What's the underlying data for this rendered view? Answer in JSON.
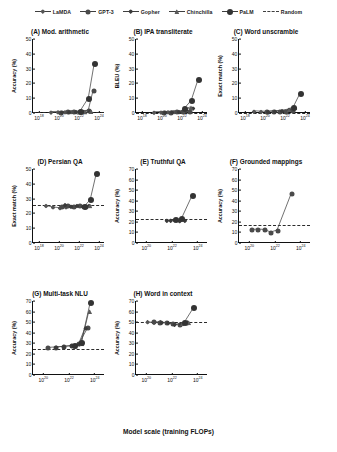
{
  "figure": {
    "xaxis_caption": "Model scale (training FLOPs)",
    "legend": [
      {
        "label": "LaMDA",
        "marker": "diamond",
        "style": "solid",
        "color": "#555555"
      },
      {
        "label": "GPT-3",
        "marker": "circle",
        "style": "solid",
        "color": "#4a4a4a"
      },
      {
        "label": "Gopher",
        "marker": "diamond",
        "style": "solid",
        "color": "#3a3a3a"
      },
      {
        "label": "Chinchilla",
        "marker": "triangle",
        "style": "solid",
        "color": "#5a5a5a"
      },
      {
        "label": "PaLM",
        "marker": "circle",
        "style": "solid",
        "color": "#333333"
      },
      {
        "label": "Random",
        "marker": "none",
        "style": "dashed",
        "color": "#3f3f3f"
      }
    ]
  },
  "chart_data": [
    {
      "type": "line",
      "panel": "A",
      "title": "(A) Mod. arithmetic",
      "xlabel": "",
      "ylabel": "Accuracy (%)",
      "ylim": [
        0,
        50
      ],
      "yticks": [
        0,
        10,
        20,
        30,
        40,
        50
      ],
      "xlim_log10": [
        17.4,
        24.6
      ],
      "xticks_log10": [
        18,
        20,
        22,
        24
      ],
      "xtick_labels": [
        "10^18",
        "10^20",
        "10^22",
        "10^24"
      ],
      "grid": false,
      "random_baseline": 0.4,
      "series": [
        {
          "name": "LaMDA",
          "x_log10": [
            19.2,
            19.9,
            20.6,
            21.2,
            21.5
          ],
          "values": [
            0.3,
            0.4,
            0.4,
            0.5,
            0.5
          ]
        },
        {
          "name": "GPT-3",
          "x_log10": [
            20.2,
            20.9,
            21.5,
            22.1,
            23.0,
            23.5
          ],
          "values": [
            0.3,
            0.4,
            0.5,
            0.6,
            1.2,
            15.0
          ]
        },
        {
          "name": "Gopher",
          "x_log10": [
            20.3,
            21.0,
            21.7,
            22.4,
            23.1
          ],
          "values": [
            0.3,
            0.4,
            0.5,
            0.6,
            1.0
          ]
        },
        {
          "name": "Chinchilla",
          "x_log10": [
            22.0,
            22.6,
            23.2
          ],
          "values": [
            0.4,
            0.6,
            1.0
          ]
        },
        {
          "name": "PaLM",
          "x_log10": [
            22.2,
            23.0,
            23.6
          ],
          "values": [
            1.0,
            9.5,
            33.0
          ]
        }
      ]
    },
    {
      "type": "line",
      "panel": "B",
      "title": "(B) IPA transliterate",
      "xlabel": "",
      "ylabel": "BLEU (%)",
      "ylim": [
        0,
        50
      ],
      "yticks": [
        0,
        10,
        20,
        30,
        40,
        50
      ],
      "xlim_log10": [
        17.4,
        24.6
      ],
      "xticks_log10": [
        18,
        20,
        22,
        24
      ],
      "xtick_labels": [
        "10^18",
        "10^20",
        "10^22",
        "10^24"
      ],
      "grid": false,
      "random_baseline": 0.3,
      "series": [
        {
          "name": "LaMDA",
          "x_log10": [
            19.2,
            19.9,
            20.6,
            21.2
          ],
          "values": [
            0.2,
            0.3,
            0.4,
            0.5
          ]
        },
        {
          "name": "GPT-3",
          "x_log10": [
            20.2,
            20.9,
            21.5,
            22.1,
            22.8
          ],
          "values": [
            0.2,
            0.3,
            0.4,
            0.6,
            1.0
          ]
        },
        {
          "name": "Gopher",
          "x_log10": [
            20.3,
            21.0,
            21.7,
            22.4,
            23.1
          ],
          "values": [
            0.3,
            0.4,
            0.5,
            1.5,
            3.0
          ]
        },
        {
          "name": "Chinchilla",
          "x_log10": [
            22.3,
            22.9
          ],
          "values": [
            1.8,
            3.5
          ]
        },
        {
          "name": "PaLM",
          "x_log10": [
            22.3,
            23.0,
            23.7
          ],
          "values": [
            2.5,
            8.0,
            22.5
          ]
        }
      ]
    },
    {
      "type": "line",
      "panel": "C",
      "title": "(C) Word unscramble",
      "xlabel": "",
      "ylabel": "Exact match (%)",
      "ylim": [
        0,
        50
      ],
      "yticks": [
        0,
        10,
        20,
        30,
        40,
        50
      ],
      "xlim_log10": [
        17.4,
        24.6
      ],
      "xticks_log10": [
        18,
        20,
        22,
        24
      ],
      "xtick_labels": [
        "10^18",
        "10^20",
        "10^22",
        "10^24"
      ],
      "grid": false,
      "random_baseline": 0.3,
      "series": [
        {
          "name": "LaMDA",
          "x_log10": [
            18.9,
            19.6,
            20.3
          ],
          "values": [
            0.8,
            0.6,
            0.5
          ]
        },
        {
          "name": "GPT-3",
          "x_log10": [
            20.2,
            20.9,
            21.5,
            22.1,
            22.8
          ],
          "values": [
            0.6,
            0.7,
            0.8,
            1.0,
            1.6
          ]
        },
        {
          "name": "Gopher",
          "x_log10": [
            20.3,
            21.0,
            21.7,
            22.4,
            23.0
          ],
          "values": [
            0.5,
            0.8,
            1.2,
            2.0,
            3.2
          ]
        },
        {
          "name": "Chinchilla",
          "x_log10": [
            22.4,
            23.0
          ],
          "values": [
            2.2,
            3.5
          ]
        },
        {
          "name": "PaLM",
          "x_log10": [
            22.9,
            23.6
          ],
          "values": [
            3.5,
            13.0
          ]
        }
      ]
    },
    {
      "type": "line",
      "panel": "D",
      "title": "(D) Persian QA",
      "xlabel": "",
      "ylabel": "Exact match (%)",
      "ylim": [
        0,
        50
      ],
      "yticks": [
        0,
        10,
        20,
        30,
        40,
        50
      ],
      "xlim_log10": [
        17.4,
        24.6
      ],
      "xticks_log10": [
        18,
        20,
        22,
        24
      ],
      "xtick_labels": [
        "10^18",
        "10^20",
        "10^22",
        "10^24"
      ],
      "grid": false,
      "random_baseline": 25.5,
      "series": [
        {
          "name": "LaMDA",
          "x_log10": [
            18.7,
            19.4,
            20.1,
            20.7
          ],
          "values": [
            25.0,
            24.0,
            23.5,
            24.0
          ]
        },
        {
          "name": "GPT-3",
          "x_log10": [
            20.3,
            20.9,
            21.5,
            22.1,
            22.7
          ],
          "values": [
            24.5,
            25.0,
            24.5,
            25.0,
            24.0
          ]
        },
        {
          "name": "Gopher",
          "x_log10": [
            20.6,
            21.2,
            21.8,
            22.4,
            23.0
          ],
          "values": [
            25.5,
            24.5,
            25.0,
            24.5,
            25.0
          ]
        },
        {
          "name": "Chinchilla",
          "x_log10": [
            22.5,
            23.1
          ],
          "values": [
            24.5,
            25.0
          ]
        },
        {
          "name": "PaLM",
          "x_log10": [
            22.6,
            23.2,
            23.8
          ],
          "values": [
            24.5,
            29.0,
            46.5
          ]
        }
      ]
    },
    {
      "type": "line",
      "panel": "E",
      "title": "(E) Truthful QA",
      "xlabel": "",
      "ylabel": "Accuracy (%)",
      "ylim": [
        0,
        70
      ],
      "yticks": [
        0,
        10,
        20,
        30,
        40,
        50,
        60,
        70
      ],
      "xlim_log10": [
        19.2,
        24.8
      ],
      "xticks_log10": [
        20,
        22,
        24
      ],
      "xtick_labels": [
        "10^20",
        "10^22",
        "10^24"
      ],
      "grid": false,
      "random_baseline": 23.0,
      "series": [
        {
          "name": "Gopher",
          "x_log10": [
            21.6,
            21.9,
            22.2,
            22.6,
            23.0
          ],
          "values": [
            21.0,
            21.0,
            21.5,
            20.5,
            21.0
          ]
        },
        {
          "name": "PaLM",
          "x_log10": [
            22.3,
            22.8,
            23.6
          ],
          "values": [
            21.5,
            23.0,
            44.0
          ]
        }
      ]
    },
    {
      "type": "line",
      "panel": "F",
      "title": "(F) Grounded mappings",
      "xlabel": "",
      "ylabel": "Accuracy (%)",
      "ylim": [
        0,
        70
      ],
      "yticks": [
        0,
        10,
        20,
        30,
        40,
        50,
        60,
        70
      ],
      "xlim_log10": [
        19.2,
        24.8
      ],
      "xticks_log10": [
        20,
        22,
        24
      ],
      "xtick_labels": [
        "10^20",
        "10^22",
        "10^24"
      ],
      "grid": false,
      "random_baseline": 17.0,
      "series": [
        {
          "name": "GPT-3",
          "x_log10": [
            20.2,
            20.7,
            21.2,
            21.7,
            22.2,
            23.3
          ],
          "values": [
            12.0,
            12.5,
            12.0,
            9.5,
            11.5,
            46.0
          ]
        }
      ]
    },
    {
      "type": "line",
      "panel": "G",
      "title": "(G) Multi-task NLU",
      "xlabel": "",
      "ylabel": "Accuracy (%)",
      "ylim": [
        0,
        70
      ],
      "yticks": [
        0,
        10,
        20,
        30,
        40,
        50,
        60,
        70
      ],
      "xlim_log10": [
        19.2,
        24.8
      ],
      "xticks_log10": [
        20,
        22,
        24
      ],
      "xtick_labels": [
        "10^20",
        "10^22",
        "10^24"
      ],
      "grid": false,
      "random_baseline": 25.0,
      "series": [
        {
          "name": "GPT-3",
          "x_log10": [
            20.4,
            21.0,
            21.6,
            22.2,
            22.8,
            23.5
          ],
          "values": [
            25.5,
            26.0,
            26.5,
            27.0,
            29.0,
            44.0
          ]
        },
        {
          "name": "Gopher",
          "x_log10": [
            21.0,
            21.6,
            22.2,
            22.8,
            23.3
          ],
          "values": [
            26.0,
            26.5,
            27.5,
            29.0,
            44.0
          ]
        },
        {
          "name": "Chinchilla",
          "x_log10": [
            22.5,
            23.0,
            23.6
          ],
          "values": [
            27.0,
            29.5,
            60.0
          ]
        },
        {
          "name": "PaLM",
          "x_log10": [
            22.5,
            23.0,
            23.7
          ],
          "values": [
            27.5,
            30.0,
            68.0
          ]
        }
      ]
    },
    {
      "type": "line",
      "panel": "H",
      "title": "(H) Word in context",
      "xlabel": "",
      "ylabel": "Accuracy (%)",
      "ylim": [
        0,
        70
      ],
      "yticks": [
        0,
        10,
        20,
        30,
        40,
        50,
        60,
        70
      ],
      "xlim_log10": [
        19.2,
        24.8
      ],
      "xticks_log10": [
        20,
        22,
        24
      ],
      "xtick_labels": [
        "10^20",
        "10^22",
        "10^24"
      ],
      "grid": false,
      "random_baseline": 50.0,
      "series": [
        {
          "name": "LaMDA",
          "x_log10": [
            20.1,
            20.6,
            21.1
          ],
          "values": [
            50.0,
            49.5,
            50.0
          ]
        },
        {
          "name": "GPT-3",
          "x_log10": [
            20.6,
            21.1,
            21.6,
            22.1,
            22.6,
            23.2
          ],
          "values": [
            50.0,
            49.5,
            49.5,
            48.5,
            47.5,
            49.0
          ]
        },
        {
          "name": "Gopher",
          "x_log10": [
            21.2,
            21.7,
            22.2,
            22.7,
            23.2
          ],
          "values": [
            49.5,
            49.0,
            47.5,
            48.0,
            49.5
          ]
        },
        {
          "name": "Chinchilla",
          "x_log10": [
            22.8,
            23.3
          ],
          "values": [
            48.5,
            49.5
          ]
        },
        {
          "name": "PaLM",
          "x_log10": [
            23.0,
            23.7
          ],
          "values": [
            49.5,
            63.0
          ]
        }
      ]
    }
  ]
}
